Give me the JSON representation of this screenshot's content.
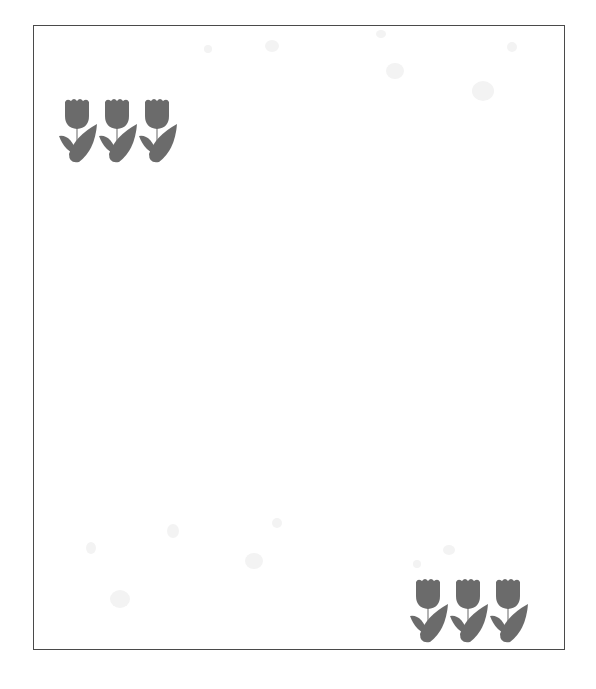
{
  "page": {
    "background_color": "#ffffff",
    "frame_border_color": "#4a4a4a"
  },
  "decorations": {
    "tulip_color": "#6b6b6b",
    "stem_color": "#9a9a9a",
    "top_left_group": {
      "icon": "tulip-icon",
      "count": 3
    },
    "bottom_right_group": {
      "icon": "tulip-icon",
      "count": 3
    },
    "background_spots_color": "#f3f3f3"
  }
}
